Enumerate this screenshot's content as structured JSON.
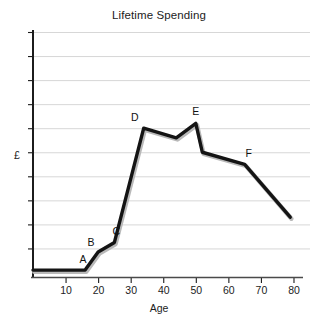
{
  "chart_data": {
    "type": "line",
    "title": "Lifetime Spending",
    "xlabel": "Age",
    "ylabel": "£",
    "xlim": [
      0,
      82
    ],
    "ylim": [
      0,
      10
    ],
    "grid": true,
    "legend": "none",
    "xticks": [
      10,
      20,
      30,
      40,
      50,
      60,
      70,
      80
    ],
    "xtick_labels": [
      "10",
      "20",
      "30",
      "40",
      "50",
      "60",
      "70",
      "80"
    ],
    "yticks": [
      1,
      2,
      3,
      4,
      5,
      6,
      7,
      8,
      9,
      10
    ],
    "ytick_labels": [
      "",
      "",
      "",
      "",
      "",
      "",
      "",
      "",
      "",
      ""
    ],
    "series": [
      {
        "name": "Spending",
        "color": "#141414",
        "x": [
          0,
          16,
          20,
          25,
          34,
          44,
          50,
          52,
          65,
          79
        ],
        "y": [
          0.1,
          0.1,
          0.85,
          1.25,
          6.0,
          5.6,
          6.2,
          5.0,
          4.5,
          2.3
        ]
      }
    ],
    "annotations": [
      {
        "label": "A",
        "x": 16,
        "y": 0.1
      },
      {
        "label": "B",
        "x": 20,
        "y": 0.85
      },
      {
        "label": "C",
        "x": 25,
        "y": 1.25
      },
      {
        "label": "D",
        "x": 34,
        "y": 6.0
      },
      {
        "label": "E",
        "x": 50,
        "y": 6.2
      },
      {
        "label": "F",
        "x": 65,
        "y": 4.5
      }
    ]
  },
  "colors": {
    "line": "#141414",
    "grid": "#d7d7d7",
    "axis": "#1c1c1c",
    "shadow": "#b9b9b9",
    "background": "#ffffff"
  }
}
